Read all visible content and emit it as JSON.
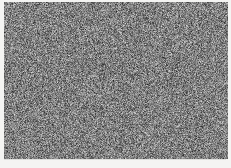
{
  "image": {
    "kind": "noise-texture",
    "title": "Random grayscale noise field",
    "width": 231,
    "height": 168,
    "description": "Full-bleed uniform random grayscale pixel noise with no legible text, icons or chart structure.",
    "alt_text": "Random grayscale noise"
  },
  "noise": {
    "pattern": "uniform-random-grayscale",
    "mean_gray": "#808080",
    "min_gray": "#141414",
    "max_gray": "#ededed",
    "pixel_size": 1,
    "monochrome": true
  },
  "plate": {
    "left": 4,
    "top": 2,
    "width": 224,
    "height": 157,
    "border_color": "#e8e8e6"
  },
  "background": {
    "page_color": "#ffffff",
    "margin_color": "#f4f4f2",
    "bottom_strip_color": "#f4f4f2",
    "bottom_strip_height": 9,
    "rule_color": "#d8d8d6"
  }
}
